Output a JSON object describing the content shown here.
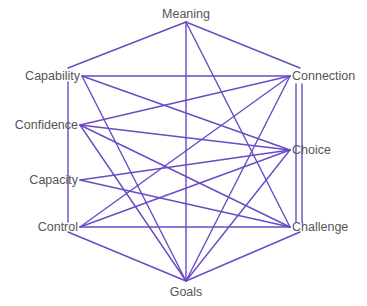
{
  "diagram": {
    "type": "network",
    "line_color": "#6a4bc4",
    "text_color": "#555555",
    "background": "#ffffff",
    "nodes": [
      {
        "id": "meaning",
        "label": "Meaning",
        "x": 186,
        "y": 22,
        "label_x": 186,
        "label_y": 7,
        "align": "center"
      },
      {
        "id": "capability",
        "label": "Capability",
        "x": 82,
        "y": 76,
        "label_x": 80,
        "label_y": 69,
        "align": "right"
      },
      {
        "id": "confidence",
        "label": "Confidence",
        "x": 80,
        "y": 125,
        "label_x": 78,
        "label_y": 118,
        "align": "right"
      },
      {
        "id": "capacity",
        "label": "Capacity",
        "x": 80,
        "y": 180,
        "label_x": 78,
        "label_y": 173,
        "align": "right"
      },
      {
        "id": "control",
        "label": "Control",
        "x": 80,
        "y": 227,
        "label_x": 78,
        "label_y": 220,
        "align": "right"
      },
      {
        "id": "connection",
        "label": "Connection",
        "x": 290,
        "y": 76,
        "label_x": 292,
        "label_y": 69,
        "align": "left"
      },
      {
        "id": "choice",
        "label": "Choice",
        "x": 290,
        "y": 150,
        "label_x": 292,
        "label_y": 143,
        "align": "left"
      },
      {
        "id": "challenge",
        "label": "Challenge",
        "x": 290,
        "y": 227,
        "label_x": 292,
        "label_y": 220,
        "align": "left"
      },
      {
        "id": "goals",
        "label": "Goals",
        "x": 186,
        "y": 281,
        "label_x": 186,
        "label_y": 285,
        "align": "center"
      }
    ],
    "edges": [
      {
        "from": "meaning",
        "to": "goals"
      },
      {
        "from": "meaning",
        "to": "challenge"
      },
      {
        "from": "capability",
        "to": "connection"
      },
      {
        "from": "capability",
        "to": "choice"
      },
      {
        "from": "capability",
        "to": "goals"
      },
      {
        "from": "confidence",
        "to": "connection"
      },
      {
        "from": "confidence",
        "to": "choice"
      },
      {
        "from": "confidence",
        "to": "challenge"
      },
      {
        "from": "confidence",
        "to": "goals"
      },
      {
        "from": "capacity",
        "to": "choice"
      },
      {
        "from": "capacity",
        "to": "challenge"
      },
      {
        "from": "control",
        "to": "connection"
      },
      {
        "from": "control",
        "to": "choice"
      },
      {
        "from": "control",
        "to": "challenge"
      },
      {
        "from": "connection",
        "to": "goals"
      },
      {
        "from": "choice",
        "to": "goals"
      }
    ],
    "frame_segments": [
      {
        "x1": 186,
        "y1": 22,
        "x2": 68,
        "y2": 68
      },
      {
        "x1": 186,
        "y1": 22,
        "x2": 300,
        "y2": 68
      },
      {
        "x1": 68,
        "y1": 82,
        "x2": 68,
        "y2": 222
      },
      {
        "x1": 296,
        "y1": 84,
        "x2": 296,
        "y2": 222
      },
      {
        "x1": 302,
        "y1": 84,
        "x2": 302,
        "y2": 222
      },
      {
        "x1": 68,
        "y1": 232,
        "x2": 186,
        "y2": 281
      },
      {
        "x1": 300,
        "y1": 232,
        "x2": 186,
        "y2": 281
      }
    ]
  }
}
